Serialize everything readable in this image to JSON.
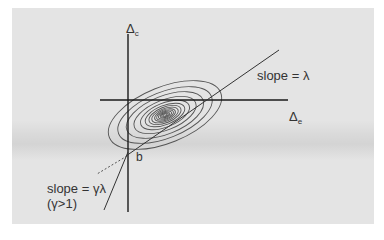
{
  "diagram": {
    "axes": {
      "y_label": "Δ",
      "y_subscript": "c",
      "x_label": "Δ",
      "x_subscript": "e"
    },
    "intercept_label": "b",
    "line_upper": {
      "label": "slope = λ"
    },
    "line_lower": {
      "label": "slope = γλ",
      "condition": "(γ>1)"
    },
    "contours": {
      "count": 14,
      "center": [
        165,
        115
      ],
      "rotation_deg": -22
    },
    "colors": {
      "background": "#e4e4e4",
      "ink": "#222222",
      "contour": "#555555"
    }
  }
}
